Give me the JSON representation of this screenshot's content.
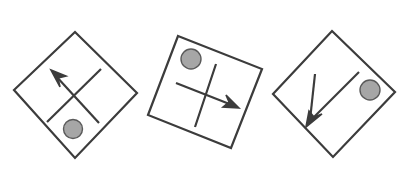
{
  "canvas": {
    "width": 413,
    "height": 177,
    "background": "#ffffff"
  },
  "style": {
    "outline_stroke": "#3c3c3c",
    "outline_stroke_width": 2.2,
    "line_stroke": "#3c3c3c",
    "line_stroke_width": 2.2,
    "circle_fill": "#a6a6a6",
    "circle_stroke": "#5a5a5a",
    "circle_stroke_width": 1.4,
    "arrow_fill": "#3c3c3c"
  },
  "figures": [
    {
      "id": "figure-1",
      "name": "diamond-with-upleft-arrow",
      "shape": "square-rotated-diamond",
      "rotation_deg": 46,
      "outline_points": "75,32 137,93 75,158 14,90",
      "cross": {
        "arrow_line": {
          "x1": 99,
          "y1": 123,
          "x2": 55,
          "y2": 75
        },
        "arrow_tip": {
          "x": 51,
          "y": 70
        },
        "arrow_direction": "up-left",
        "arrowhead_points": "51,70 66,76 58,78 60,87",
        "plain_line": {
          "x1": 47,
          "y1": 122,
          "x2": 101,
          "y2": 69
        }
      },
      "circle": {
        "cx": 73,
        "cy": 129,
        "r": 9.5,
        "position": "bottom"
      }
    },
    {
      "id": "figure-2",
      "name": "square-with-right-arrow",
      "shape": "square-tilted",
      "rotation_deg": 21,
      "outline_points": "178,36 262,69 231,148 148,115",
      "cross": {
        "arrow_line": {
          "x1": 176,
          "y1": 83,
          "x2": 232,
          "y2": 105
        },
        "arrow_tip": {
          "x": 239,
          "y": 108
        },
        "arrow_direction": "right",
        "arrowhead_points": "239,108 223,107 229,102 226,95",
        "plain_line": {
          "x1": 216,
          "y1": 64,
          "x2": 195,
          "y2": 127
        }
      },
      "circle": {
        "cx": 191,
        "cy": 59,
        "r": 10,
        "position": "top-left"
      }
    },
    {
      "id": "figure-3",
      "name": "diamond-with-downleft-arrow",
      "shape": "square-rotated-diamond",
      "rotation_deg": 44,
      "outline_points": "332,31 395,92 333,157 273,94",
      "cross": {
        "arrow_line": {
          "x1": 315,
          "y1": 74,
          "x2": 310,
          "y2": 120
        },
        "arrow_tip": {
          "x": 306,
          "y": 127
        },
        "arrow_direction": "down-left",
        "arrowhead_points": "306,127 309,111 314,117 322,114",
        "plain_line": {
          "x1": 359,
          "y1": 72,
          "x2": 307,
          "y2": 124
        }
      },
      "circle": {
        "cx": 370,
        "cy": 90,
        "r": 10,
        "position": "right"
      }
    }
  ]
}
